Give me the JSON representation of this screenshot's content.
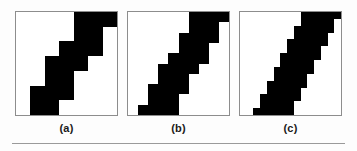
{
  "figure": {
    "caption_labels": [
      "(a)",
      "(b)",
      "(c)"
    ],
    "colors": {
      "ink": "#000000",
      "paper": "#ffffff",
      "panel_border": "#8d8d8d",
      "rule": "#9a9a9a",
      "page_background": "#fdfdfd",
      "label_text": "#1a1a1a"
    },
    "has_bottom_rule": true
  },
  "panels": [
    {
      "label": "(a)",
      "grid": 7,
      "description": "coarse staircase diagonal band",
      "rows": [
        {
          "start": 4,
          "end": 6
        },
        {
          "start": 4,
          "end": 5
        },
        {
          "start": 3,
          "end": 5
        },
        {
          "start": 2,
          "end": 4
        },
        {
          "start": 2,
          "end": 3
        },
        {
          "start": 1,
          "end": 3
        },
        {
          "start": 1,
          "end": 2
        }
      ]
    },
    {
      "label": "(b)",
      "grid": 10,
      "description": "medium staircase diagonal band",
      "rows": [
        {
          "start": 6,
          "end": 9
        },
        {
          "start": 6,
          "end": 8
        },
        {
          "start": 5,
          "end": 8
        },
        {
          "start": 5,
          "end": 7
        },
        {
          "start": 4,
          "end": 7
        },
        {
          "start": 3,
          "end": 6
        },
        {
          "start": 3,
          "end": 5
        },
        {
          "start": 2,
          "end": 5
        },
        {
          "start": 2,
          "end": 4
        },
        {
          "start": 1,
          "end": 4
        }
      ]
    },
    {
      "label": "(c)",
      "grid": 15,
      "description": "fine staircase diagonal band",
      "rows": [
        {
          "start": 9,
          "end": 14
        },
        {
          "start": 9,
          "end": 13
        },
        {
          "start": 8,
          "end": 13
        },
        {
          "start": 8,
          "end": 12
        },
        {
          "start": 7,
          "end": 12
        },
        {
          "start": 7,
          "end": 11
        },
        {
          "start": 6,
          "end": 11
        },
        {
          "start": 6,
          "end": 10
        },
        {
          "start": 5,
          "end": 10
        },
        {
          "start": 5,
          "end": 9
        },
        {
          "start": 4,
          "end": 9
        },
        {
          "start": 4,
          "end": 8
        },
        {
          "start": 3,
          "end": 8
        },
        {
          "start": 3,
          "end": 7
        },
        {
          "start": 2,
          "end": 7
        }
      ]
    }
  ]
}
